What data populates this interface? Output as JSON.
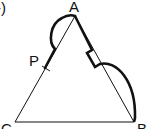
{
  "figure": {
    "part_label": "-)",
    "vertices": {
      "A": {
        "label": "A",
        "x": 75,
        "y": 16
      },
      "B": {
        "label": "B",
        "x": 134,
        "y": 122
      },
      "C": {
        "label": "C",
        "x": 15,
        "y": 122
      },
      "P": {
        "label": "P",
        "x": 45,
        "y": 68
      }
    },
    "colors": {
      "line": "#111111",
      "background": "#ffffff"
    }
  }
}
